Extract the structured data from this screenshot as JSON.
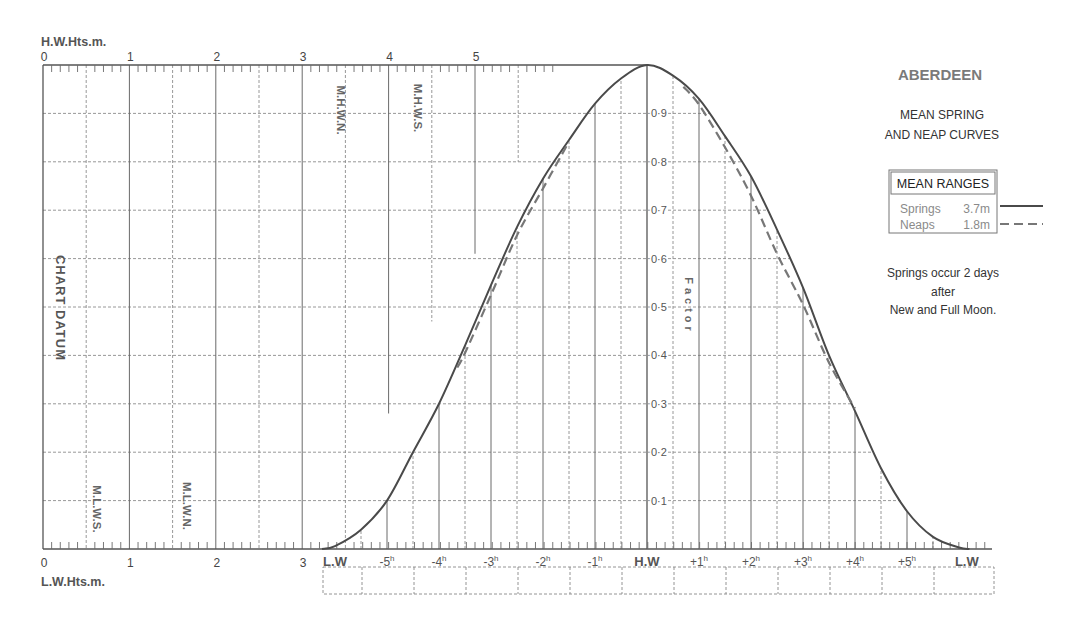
{
  "colors": {
    "curve": "#4a4a4a",
    "grid": "#6a6a6a",
    "title": "#7a7a7a",
    "muted": "#8a8a8a",
    "text": "#444444"
  },
  "chart_data": {
    "type": "line",
    "title": "ABERDEEN",
    "subtitle": [
      "MEAN SPRING",
      "AND NEAP CURVES"
    ],
    "xlabel": "",
    "ylabel": "Factor",
    "ylim": [
      0,
      1
    ],
    "xlim_hours": [
      -6.25,
      6.2
    ],
    "grid": true,
    "y_ticks": [
      {
        "value": 0.1,
        "label": "0·1"
      },
      {
        "value": 0.2,
        "label": "0·2"
      },
      {
        "value": 0.3,
        "label": "0·3"
      },
      {
        "value": 0.4,
        "label": "0·4"
      },
      {
        "value": 0.5,
        "label": "0·5"
      },
      {
        "value": 0.6,
        "label": "0·6"
      },
      {
        "value": 0.7,
        "label": "0·7"
      },
      {
        "value": 0.8,
        "label": "0·8"
      },
      {
        "value": 0.9,
        "label": "0·9"
      }
    ],
    "time_ticks": [
      {
        "hour": -6,
        "label": "L.W",
        "sup": "",
        "bold": true
      },
      {
        "hour": -5,
        "label": "-5",
        "sup": "h"
      },
      {
        "hour": -4,
        "label": "-4",
        "sup": "h"
      },
      {
        "hour": -3,
        "label": "-3",
        "sup": "h"
      },
      {
        "hour": -2,
        "label": "-2",
        "sup": "h"
      },
      {
        "hour": -1,
        "label": "-1",
        "sup": "h"
      },
      {
        "hour": 0,
        "label": "H.W",
        "sup": "",
        "bold": true
      },
      {
        "hour": 1,
        "label": "+1",
        "sup": "h"
      },
      {
        "hour": 2,
        "label": "+2",
        "sup": "h"
      },
      {
        "hour": 3,
        "label": "+3",
        "sup": "h"
      },
      {
        "hour": 4,
        "label": "+4",
        "sup": "h"
      },
      {
        "hour": 5,
        "label": "+5",
        "sup": "h"
      },
      {
        "hour": 6.15,
        "label": "L.W",
        "sup": "",
        "bold": true
      }
    ],
    "height_axis_top": {
      "label": "H.W.Hts.m.",
      "range_m": [
        0,
        7
      ],
      "ticks": [
        {
          "value": 0,
          "label": "0"
        },
        {
          "value": 1,
          "label": "1"
        },
        {
          "value": 2,
          "label": "2"
        },
        {
          "value": 3,
          "label": "3"
        },
        {
          "value": 4,
          "label": "4"
        },
        {
          "value": 5,
          "label": "5"
        }
      ]
    },
    "height_axis_bottom": {
      "label": "L.W.Hts.m.",
      "range_m": [
        0,
        11
      ],
      "ticks": [
        {
          "value": 0,
          "label": "0"
        },
        {
          "value": 1,
          "label": "1"
        },
        {
          "value": 2,
          "label": "2"
        },
        {
          "value": 3,
          "label": "3"
        }
      ]
    },
    "datum_label": "CHART DATUM",
    "levels": [
      {
        "label": "M.H.W.N.",
        "height_m": 3.4,
        "axis": "top"
      },
      {
        "label": "M.H.W.S.",
        "height_m": 4.3,
        "axis": "top"
      },
      {
        "label": "M.L.W.S.",
        "height_m": 0.6,
        "axis": "bottom"
      },
      {
        "label": "M.L.W.N.",
        "height_m": 1.6,
        "axis": "bottom"
      }
    ],
    "series": [
      {
        "name": "Springs",
        "style": "solid",
        "mean_range": "3.7m",
        "points": [
          [
            -6.25,
            0
          ],
          [
            -6.0,
            0.006
          ],
          [
            -5.5,
            0.04
          ],
          [
            -5,
            0.1
          ],
          [
            -4.5,
            0.2
          ],
          [
            -4,
            0.3
          ],
          [
            -3.5,
            0.42
          ],
          [
            -3,
            0.545
          ],
          [
            -2.5,
            0.665
          ],
          [
            -2,
            0.765
          ],
          [
            -1.5,
            0.845
          ],
          [
            -1,
            0.92
          ],
          [
            -0.5,
            0.972
          ],
          [
            0,
            1.0
          ],
          [
            0.5,
            0.978
          ],
          [
            1,
            0.93
          ],
          [
            1.5,
            0.853
          ],
          [
            2,
            0.77
          ],
          [
            2.5,
            0.66
          ],
          [
            3,
            0.54
          ],
          [
            3.5,
            0.4
          ],
          [
            4,
            0.285
          ],
          [
            4.5,
            0.167
          ],
          [
            5,
            0.078
          ],
          [
            5.5,
            0.025
          ],
          [
            6,
            0.003
          ],
          [
            6.2,
            0
          ]
        ]
      },
      {
        "name": "Neaps",
        "style": "dashed",
        "mean_range": "1.8m",
        "segments": [
          [
            [
              -3.65,
              0.375
            ],
            [
              -3.5,
              0.405
            ],
            [
              -3,
              0.525
            ],
            [
              -2.5,
              0.648
            ],
            [
              -2,
              0.745
            ],
            [
              -1.55,
              0.832
            ]
          ],
          [
            [
              0.7,
              0.955
            ],
            [
              1,
              0.918
            ],
            [
              1.5,
              0.83
            ],
            [
              2,
              0.73
            ],
            [
              2.5,
              0.61
            ],
            [
              3,
              0.505
            ],
            [
              3.5,
              0.385
            ],
            [
              4,
              0.29
            ]
          ]
        ]
      }
    ],
    "legend": {
      "title": "MEAN RANGES",
      "position": "right",
      "entries": [
        {
          "name": "Springs",
          "value": "3.7m",
          "style": "solid"
        },
        {
          "name": "Neaps",
          "value": "1.8m",
          "style": "dashed"
        }
      ]
    },
    "note": [
      "Springs occur 2 days",
      "after",
      "New and Full Moon."
    ]
  }
}
